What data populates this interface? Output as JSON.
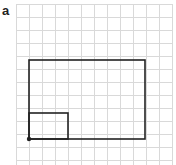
{
  "panel_label": "a",
  "grid": {
    "x0": 16,
    "y0": 4,
    "cell": 13,
    "cols": 12,
    "rows": 13,
    "color": "#d9d9d9"
  },
  "shapes": {
    "large_rectangle": {
      "x": 29,
      "y": 60,
      "w": 116,
      "h": 79
    },
    "small_rectangle": {
      "x": 29,
      "y": 113,
      "w": 39,
      "h": 26
    },
    "origin_point": {
      "cx": 29,
      "cy": 139
    }
  },
  "stroke_color": "#222222"
}
